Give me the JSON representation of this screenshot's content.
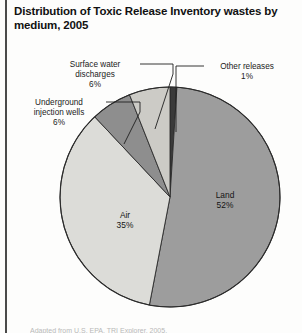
{
  "figure": {
    "title": "Distribution of Toxic Release Inventory wastes by medium, 2005",
    "source_note": "Adapted from U.S. EPA, TRI Explorer, 2005.",
    "colors": {
      "land": "#9d9d9d",
      "air": "#dcdcd8",
      "underground_injection_wells": "#8e8e8e",
      "surface_water_discharges": "#cccbc6",
      "other_releases": "#3a3a3a",
      "outline": "#2b2b2b",
      "leader": "#1f1f1f",
      "text": "#111111",
      "frame_rule": "#4a4a4a"
    }
  },
  "callouts": {
    "surface_water": "Surface water\ndischarges\n6%",
    "underground": "Underground\ninjection wells\n6%",
    "other": "Other releases\n1%"
  },
  "slice_labels": {
    "land": "Land\n52%",
    "air": "Air\n35%"
  },
  "chart_data": {
    "type": "pie",
    "title": "Distribution of Toxic Release Inventory wastes by medium, 2005",
    "xlabel": "",
    "ylabel": "",
    "units": "percent",
    "total": 100,
    "start_angle_deg": 0,
    "direction": "clockwise",
    "legend_position": "none",
    "grid": false,
    "labels": [
      "Other releases",
      "Land",
      "Air",
      "Underground injection wells",
      "Surface water discharges"
    ],
    "values": [
      1,
      52,
      35,
      6,
      6
    ],
    "slices": [
      {
        "label": "Other releases",
        "value": 1,
        "display": "1%",
        "color": "#3a3a3a",
        "label_placement": "callout-right"
      },
      {
        "label": "Land",
        "value": 52,
        "display": "52%",
        "color": "#9d9d9d",
        "label_placement": "inside"
      },
      {
        "label": "Air",
        "value": 35,
        "display": "35%",
        "color": "#dcdcd8",
        "label_placement": "inside"
      },
      {
        "label": "Underground injection wells",
        "value": 6,
        "display": "6%",
        "color": "#8e8e8e",
        "label_placement": "callout-left"
      },
      {
        "label": "Surface water discharges",
        "value": 6,
        "display": "6%",
        "color": "#cccbc6",
        "label_placement": "callout-top-left"
      }
    ]
  }
}
